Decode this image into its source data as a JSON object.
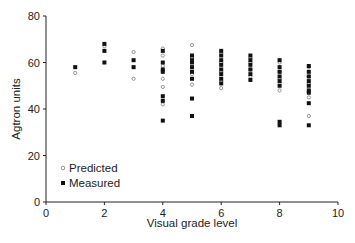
{
  "chart_data": {
    "type": "scatter",
    "title": "",
    "xlabel": "Visual grade level",
    "ylabel": "Agtron units",
    "xlim": [
      0,
      10
    ],
    "ylim": [
      0,
      80
    ],
    "xticks": [
      0,
      2,
      4,
      6,
      8,
      10
    ],
    "yticks": [
      0,
      20,
      40,
      60,
      80
    ],
    "grid": false,
    "legend_position": "lower-left inside",
    "series": [
      {
        "name": "Predicted",
        "marker": "small-open-circle",
        "color": "#888888",
        "points": [
          [
            1,
            55.5
          ],
          [
            2,
            67
          ],
          [
            3,
            64.5
          ],
          [
            3,
            53
          ],
          [
            4,
            66
          ],
          [
            4,
            63
          ],
          [
            4,
            58.5
          ],
          [
            4,
            53
          ],
          [
            4,
            49.5
          ],
          [
            4,
            42
          ],
          [
            5,
            67.5
          ],
          [
            5,
            62
          ],
          [
            5,
            58
          ],
          [
            5,
            55
          ],
          [
            5,
            50.5
          ],
          [
            6,
            64
          ],
          [
            6,
            60
          ],
          [
            6,
            56
          ],
          [
            6,
            52
          ],
          [
            6,
            49
          ],
          [
            7,
            62
          ],
          [
            7,
            60
          ],
          [
            7,
            57
          ],
          [
            7,
            54
          ],
          [
            8,
            60
          ],
          [
            8,
            56
          ],
          [
            8,
            53
          ],
          [
            8,
            48
          ],
          [
            9,
            58
          ],
          [
            9,
            54
          ],
          [
            9,
            51
          ],
          [
            9,
            45
          ],
          [
            9,
            37
          ]
        ]
      },
      {
        "name": "Measured",
        "marker": "filled-square",
        "color": "#111111",
        "points": [
          [
            1,
            58
          ],
          [
            2,
            68
          ],
          [
            2,
            65
          ],
          [
            2,
            60
          ],
          [
            3,
            61
          ],
          [
            3,
            58
          ],
          [
            4,
            65
          ],
          [
            4,
            60
          ],
          [
            4,
            57
          ],
          [
            4,
            56
          ],
          [
            4,
            45.5
          ],
          [
            4,
            43.5
          ],
          [
            4,
            35
          ],
          [
            5,
            63
          ],
          [
            5,
            61
          ],
          [
            5,
            60
          ],
          [
            5,
            58
          ],
          [
            5,
            56
          ],
          [
            5,
            53
          ],
          [
            5,
            44.5
          ],
          [
            5,
            37
          ],
          [
            6,
            65
          ],
          [
            6,
            63
          ],
          [
            6,
            61
          ],
          [
            6,
            59
          ],
          [
            6,
            57
          ],
          [
            6,
            55
          ],
          [
            6,
            53
          ],
          [
            6,
            51
          ],
          [
            7,
            63
          ],
          [
            7,
            61
          ],
          [
            7,
            59
          ],
          [
            7,
            57
          ],
          [
            7,
            55
          ],
          [
            7,
            52.5
          ],
          [
            8,
            61
          ],
          [
            8,
            58
          ],
          [
            8,
            56
          ],
          [
            8,
            54
          ],
          [
            8,
            52
          ],
          [
            8,
            50
          ],
          [
            8,
            34.5
          ],
          [
            8,
            33
          ],
          [
            9,
            58.5
          ],
          [
            9,
            56
          ],
          [
            9,
            54
          ],
          [
            9,
            52
          ],
          [
            9,
            50
          ],
          [
            9,
            48
          ],
          [
            9,
            47
          ],
          [
            9,
            42.5
          ],
          [
            9,
            33
          ]
        ]
      }
    ]
  },
  "legend": {
    "predicted_label": "Predicted",
    "measured_label": "Measured"
  },
  "axes": {
    "x_title": "Visual grade level",
    "y_title": "Agtron units"
  }
}
